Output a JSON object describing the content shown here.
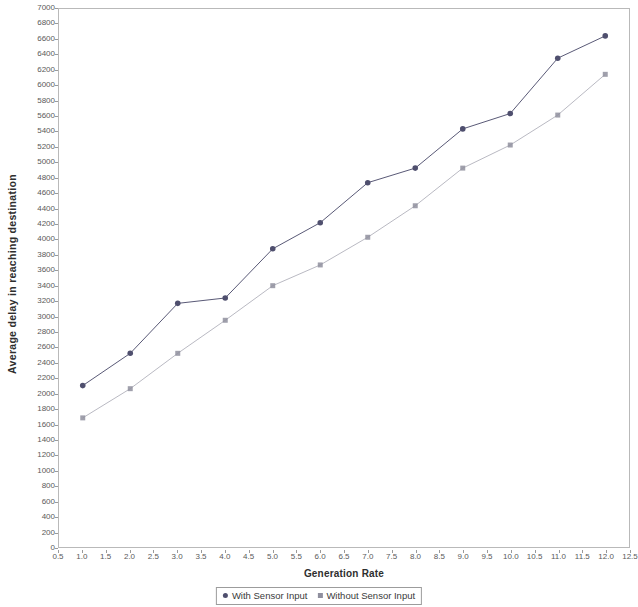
{
  "chart_data": {
    "type": "line",
    "title": "",
    "subtitle": "",
    "xlabel": "Generation Rate",
    "ylabel": "Average delay in reaching destination",
    "x": [
      1,
      2,
      3,
      4,
      5,
      6,
      7,
      8,
      9,
      10,
      11,
      12
    ],
    "series": [
      {
        "name": "With Sensor Input",
        "color": "#4f4f6e",
        "marker": "circle",
        "values": [
          2100,
          2520,
          3170,
          3240,
          3880,
          4220,
          4740,
          4930,
          5440,
          5640,
          6360,
          6650
        ]
      },
      {
        "name": "Without Sensor Input",
        "color": "#8f8f9e",
        "marker": "square",
        "values": [
          1680,
          2060,
          2520,
          2950,
          3400,
          3670,
          4030,
          4440,
          4930,
          5230,
          5620,
          6150
        ]
      }
    ],
    "xlim": [
      0.5,
      12.5
    ],
    "ylim": [
      0,
      7000
    ],
    "xticks": [
      "0.5",
      "1.0",
      "1.5",
      "2.0",
      "2.5",
      "3.0",
      "3.5",
      "4.0",
      "4.5",
      "5.0",
      "5.5",
      "6.0",
      "6.5",
      "7.0",
      "7.5",
      "8.0",
      "8.5",
      "9.0",
      "9.5",
      "10.0",
      "10.5",
      "11.0",
      "11.5",
      "12.0",
      "12.5"
    ],
    "xtick_values": [
      0.5,
      1.0,
      1.5,
      2.0,
      2.5,
      3.0,
      3.5,
      4.0,
      4.5,
      5.0,
      5.5,
      6.0,
      6.5,
      7.0,
      7.5,
      8.0,
      8.5,
      9.0,
      9.5,
      10.0,
      10.5,
      11.0,
      11.5,
      12.0,
      12.5
    ],
    "yticks": [
      "0",
      "200",
      "400",
      "600",
      "800",
      "1000",
      "1200",
      "1400",
      "1600",
      "1800",
      "2000",
      "2200",
      "2400",
      "2600",
      "2800",
      "3000",
      "3200",
      "3400",
      "3600",
      "3800",
      "4000",
      "4200",
      "4400",
      "4600",
      "4800",
      "5000",
      "5200",
      "5400",
      "5600",
      "5800",
      "6000",
      "6200",
      "6400",
      "6600",
      "6800",
      "7000"
    ],
    "ytick_values": [
      0,
      200,
      400,
      600,
      800,
      1000,
      1200,
      1400,
      1600,
      1800,
      2000,
      2200,
      2400,
      2600,
      2800,
      3000,
      3200,
      3400,
      3600,
      3800,
      4000,
      4200,
      4400,
      4600,
      4800,
      5000,
      5200,
      5400,
      5600,
      5800,
      6000,
      6200,
      6400,
      6600,
      6800,
      7000
    ],
    "grid": false,
    "legend_position": "bottom",
    "plot_border_color": "#b9b9b9",
    "background_color": "#ffffff"
  },
  "legend": {
    "items": [
      {
        "label": "With Sensor Input",
        "color": "#4f4f6e"
      },
      {
        "label": "Without Sensor Input",
        "color": "#8f8f9e"
      }
    ]
  }
}
